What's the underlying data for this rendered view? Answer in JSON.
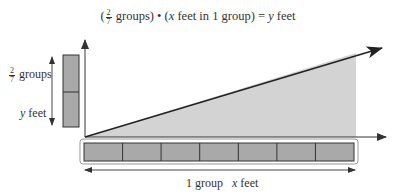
{
  "equation": {
    "open_paren": "(",
    "fraction": {
      "numerator": "2",
      "denominator": "7"
    },
    "groups_word": "groups)",
    "bullet": "•",
    "paren2_open": "(",
    "var_x": "x",
    "middle_text": "feet in 1 group) =",
    "var_y": "y",
    "end_text": "feet"
  },
  "left_labels": {
    "fraction": {
      "numerator": "2",
      "denominator": "7"
    },
    "groups_word": "groups",
    "var_y": "y",
    "feet_word": "feet"
  },
  "bottom_labels": {
    "one_group": "1 group",
    "var_x": "x",
    "feet_word": "feet"
  },
  "tape": {
    "horizontal_cells": 7,
    "vertical_cells": 2
  },
  "colors": {
    "axis": "#333333",
    "shade": "#d3d3d3",
    "tape_fill": "#a9a9a9",
    "tape_border": "#333333",
    "outer_box": "#999999"
  }
}
